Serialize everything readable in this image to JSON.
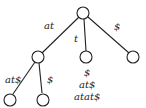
{
  "nodes": [
    {
      "id": "root",
      "x": 83,
      "y": 13
    },
    {
      "id": "n_at",
      "x": 38,
      "y": 57
    },
    {
      "id": "n_t",
      "x": 86,
      "y": 57
    },
    {
      "id": "n_dollar",
      "x": 133,
      "y": 57
    },
    {
      "id": "leaf_at_at",
      "x": 10,
      "y": 99
    },
    {
      "id": "leaf_at_dollar",
      "x": 43,
      "y": 99
    }
  ],
  "edges": [
    {
      "from": "root",
      "to": "n_at",
      "label": "at"
    },
    {
      "from": "root",
      "to": "n_t",
      "label": "t"
    },
    {
      "from": "root",
      "to": "n_dollar",
      "label": "$"
    },
    {
      "from": "n_at",
      "to": "leaf_at_at",
      "label": "at$"
    },
    {
      "from": "n_at",
      "to": "leaf_at_dollar",
      "label": "$"
    }
  ],
  "labels": {
    "edge_at": "at",
    "edge_t": "t",
    "edge_dollar": "$",
    "edge_at_dollar": "at$",
    "edge_dollar2": "$",
    "t_suffixes": [
      "$",
      "at$",
      "atat$"
    ]
  }
}
